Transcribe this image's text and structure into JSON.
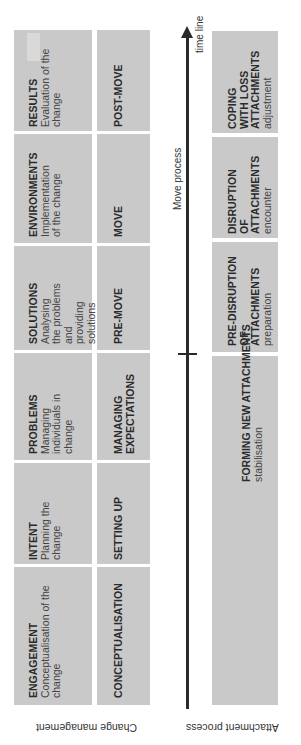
{
  "colors": {
    "box": "#c9c9c9",
    "axis": "#2a2a2a",
    "text": "#2b2b2b"
  },
  "timeline": {
    "label": "time line",
    "axis_label": "Move process"
  },
  "rows": {
    "change_management": {
      "label": "Change management",
      "phases": [
        {
          "title": "ENGAGEMENT",
          "desc": "Conceptualisation of the change"
        },
        {
          "title": "INTENT",
          "desc": "Planning the change"
        },
        {
          "title": "PROBLEMS",
          "desc": "Managing individuals in change"
        },
        {
          "title": "SOLUTIONS",
          "desc": "Analysing the problems and providing solutions"
        },
        {
          "title": "ENVIRONMENTS",
          "desc": "Implementation of the change"
        },
        {
          "title": "RESULTS",
          "desc": "Evaluation of the change"
        }
      ],
      "stages": [
        {
          "title": "CONCEPTUALISATION"
        },
        {
          "title": "SETTING UP"
        },
        {
          "title": "MANAGING EXPECTATIONS"
        },
        {
          "title": "PRE-MOVE"
        },
        {
          "title": "MOVE"
        },
        {
          "title": "POST-MOVE"
        }
      ]
    },
    "attachment_process": {
      "label": "Attachment process",
      "phases": [
        {
          "title": "FORMING NEW ATTACHMENTS",
          "desc": "stabilisation"
        },
        {
          "title": "PRE-DISRUPTION OF ATTACHMENTS",
          "desc": "preparation"
        },
        {
          "title": "DISRUPTION OF ATTACHMENTS",
          "desc": "encounter"
        },
        {
          "title": "COPING WITH LOSS ATTACHMENTS",
          "desc": "adjustment"
        }
      ]
    }
  }
}
